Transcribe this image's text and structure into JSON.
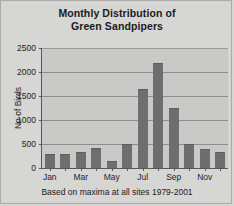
{
  "chart_data": {
    "type": "bar",
    "title": "Monthly Distribution of Green Sandpipers",
    "title_line1": "Monthly Distribution of",
    "title_line2": "Green Sandpipers",
    "caption": "Based on maxima at all sites 1979-2001",
    "xlabel": "",
    "ylabel": "No of Birds",
    "ylim": [
      0,
      2500
    ],
    "ytick_values": [
      0,
      500,
      1000,
      1500,
      2000,
      2500
    ],
    "ytick_labels": [
      "0",
      "500",
      "1000",
      "1500",
      "2000",
      "2500"
    ],
    "grid": true,
    "legend": false,
    "categories": [
      "Jan",
      "Feb",
      "Mar",
      "Apr",
      "May",
      "Jun",
      "Jul",
      "Aug",
      "Sep",
      "Oct",
      "Nov",
      "Dec"
    ],
    "visible_tick_labels": [
      "Jan",
      "",
      "Mar",
      "",
      "May",
      "",
      "Jul",
      "",
      "Sep",
      "",
      "Nov",
      ""
    ],
    "values": [
      300,
      290,
      330,
      420,
      150,
      500,
      1650,
      2180,
      1250,
      500,
      400,
      330
    ],
    "bar_color": "#6e6e6e",
    "plot_background": "#c9c9c7",
    "page_background": "#d6d6d4",
    "axis_color": "#58585a",
    "gridline_color": "#8e8e8e"
  }
}
